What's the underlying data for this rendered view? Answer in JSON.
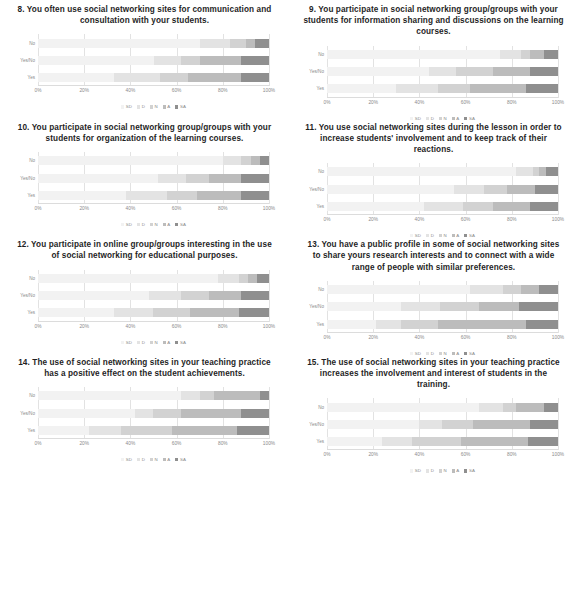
{
  "document": {
    "type": "survey-results-figure-page",
    "axis_ticks": [
      "0%",
      "20%",
      "40%",
      "60%",
      "80%",
      "100%"
    ],
    "category_labels": [
      "No",
      "Yes/No",
      "Yes"
    ],
    "legend": [
      {
        "label": "SD",
        "color": "#f2f2f2"
      },
      {
        "label": "D",
        "color": "#e3e3e3"
      },
      {
        "label": "N",
        "color": "#d2d2d2"
      },
      {
        "label": "A",
        "color": "#bcbcbc"
      },
      {
        "label": "SA",
        "color": "#8f8f8f"
      }
    ]
  },
  "chart_data": [
    {
      "type": "bar",
      "id": "q8",
      "title": "8. You often use social networking sites for communication and consultation with your students.",
      "orientation": "horizontal",
      "stacked": true,
      "normalized": true,
      "xlabel": "",
      "ylabel": "",
      "xlim": [
        0,
        100
      ],
      "grid": true,
      "legend_position": "bottom",
      "categories": [
        "No",
        "Yes/No",
        "Yes"
      ],
      "series": [
        {
          "name": "SD",
          "values": [
            70,
            50,
            33
          ]
        },
        {
          "name": "D",
          "values": [
            13,
            12,
            20
          ]
        },
        {
          "name": "N",
          "values": [
            7,
            8,
            12
          ]
        },
        {
          "name": "A",
          "values": [
            4,
            18,
            23
          ]
        },
        {
          "name": "SA",
          "values": [
            6,
            12,
            12
          ]
        }
      ]
    },
    {
      "type": "bar",
      "id": "q9",
      "title": "9. You participate in social networking group/groups with your students for information sharing and discussions on the learning courses.",
      "orientation": "horizontal",
      "stacked": true,
      "normalized": true,
      "xlabel": "",
      "ylabel": "",
      "xlim": [
        0,
        100
      ],
      "grid": true,
      "legend_position": "bottom",
      "categories": [
        "No",
        "Yes/No",
        "Yes"
      ],
      "series": [
        {
          "name": "SD",
          "values": [
            75,
            44,
            30
          ]
        },
        {
          "name": "D",
          "values": [
            9,
            12,
            18
          ]
        },
        {
          "name": "N",
          "values": [
            4,
            16,
            14
          ]
        },
        {
          "name": "A",
          "values": [
            6,
            16,
            24
          ]
        },
        {
          "name": "SA",
          "values": [
            6,
            12,
            14
          ]
        }
      ]
    },
    {
      "type": "bar",
      "id": "q10",
      "title": "10. You participate in social networking group/groups with your students for organization of the learning courses.",
      "orientation": "horizontal",
      "stacked": true,
      "normalized": true,
      "xlabel": "",
      "ylabel": "",
      "xlim": [
        0,
        100
      ],
      "grid": true,
      "legend_position": "bottom",
      "categories": [
        "No",
        "Yes/No",
        "Yes"
      ],
      "series": [
        {
          "name": "SD",
          "values": [
            80,
            52,
            38
          ]
        },
        {
          "name": "D",
          "values": [
            8,
            12,
            18
          ]
        },
        {
          "name": "N",
          "values": [
            4,
            10,
            13
          ]
        },
        {
          "name": "A",
          "values": [
            4,
            14,
            19
          ]
        },
        {
          "name": "SA",
          "values": [
            4,
            12,
            12
          ]
        }
      ]
    },
    {
      "type": "bar",
      "id": "q11",
      "title": "11. You use social networking sites during the lesson in order to increase students' involvement and to keep track of their reactions.",
      "orientation": "horizontal",
      "stacked": true,
      "normalized": true,
      "xlabel": "",
      "ylabel": "",
      "xlim": [
        0,
        100
      ],
      "grid": true,
      "legend_position": "bottom",
      "categories": [
        "No",
        "Yes/No",
        "Yes"
      ],
      "series": [
        {
          "name": "SD",
          "values": [
            82,
            55,
            42
          ]
        },
        {
          "name": "D",
          "values": [
            7,
            13,
            17
          ]
        },
        {
          "name": "N",
          "values": [
            3,
            10,
            13
          ]
        },
        {
          "name": "A",
          "values": [
            3,
            12,
            16
          ]
        },
        {
          "name": "SA",
          "values": [
            5,
            10,
            12
          ]
        }
      ]
    },
    {
      "type": "bar",
      "id": "q12",
      "title": "12. You participate in online group/groups interesting in the use of social networking for educational purposes.",
      "orientation": "horizontal",
      "stacked": true,
      "normalized": true,
      "xlabel": "",
      "ylabel": "",
      "xlim": [
        0,
        100
      ],
      "grid": true,
      "legend_position": "bottom",
      "categories": [
        "No",
        "Yes/No",
        "Yes"
      ],
      "series": [
        {
          "name": "SD",
          "values": [
            78,
            48,
            33
          ]
        },
        {
          "name": "D",
          "values": [
            9,
            14,
            17
          ]
        },
        {
          "name": "N",
          "values": [
            4,
            12,
            16
          ]
        },
        {
          "name": "A",
          "values": [
            4,
            14,
            21
          ]
        },
        {
          "name": "SA",
          "values": [
            5,
            12,
            13
          ]
        }
      ]
    },
    {
      "type": "bar",
      "id": "q13",
      "title": "13. You have a public profile in some of social networking sites to share yours research interests and to connect with a wide range of people with similar preferences.",
      "orientation": "horizontal",
      "stacked": true,
      "normalized": true,
      "xlabel": "",
      "ylabel": "",
      "xlim": [
        0,
        100
      ],
      "grid": true,
      "legend_position": "bottom",
      "categories": [
        "No",
        "Yes/No",
        "Yes"
      ],
      "series": [
        {
          "name": "SD",
          "values": [
            62,
            32,
            21
          ]
        },
        {
          "name": "D",
          "values": [
            14,
            17,
            11
          ]
        },
        {
          "name": "N",
          "values": [
            8,
            17,
            16
          ]
        },
        {
          "name": "A",
          "values": [
            8,
            17,
            38
          ]
        },
        {
          "name": "SA",
          "values": [
            8,
            17,
            14
          ]
        }
      ]
    },
    {
      "type": "bar",
      "id": "q14",
      "title": "14. The use of social networking sites in your teaching practice has a positive effect on the student achievements.",
      "orientation": "horizontal",
      "stacked": true,
      "normalized": true,
      "xlabel": "",
      "ylabel": "",
      "xlim": [
        0,
        100
      ],
      "grid": true,
      "legend_position": "bottom",
      "categories": [
        "No",
        "Yes/No",
        "Yes"
      ],
      "series": [
        {
          "name": "SD",
          "values": [
            62,
            42,
            22
          ]
        },
        {
          "name": "D",
          "values": [
            8,
            8,
            14
          ]
        },
        {
          "name": "N",
          "values": [
            6,
            12,
            22
          ]
        },
        {
          "name": "A",
          "values": [
            20,
            26,
            28
          ]
        },
        {
          "name": "SA",
          "values": [
            4,
            12,
            14
          ]
        }
      ]
    },
    {
      "type": "bar",
      "id": "q15",
      "title": "15. The use of social networking sites in your teaching practice increases the involvement and interest of students in the training.",
      "orientation": "horizontal",
      "stacked": true,
      "normalized": true,
      "xlabel": "",
      "ylabel": "",
      "xlim": [
        0,
        100
      ],
      "grid": true,
      "legend_position": "bottom",
      "categories": [
        "No",
        "Yes/No",
        "Yes"
      ],
      "series": [
        {
          "name": "SD",
          "values": [
            66,
            40,
            24
          ]
        },
        {
          "name": "D",
          "values": [
            10,
            10,
            13
          ]
        },
        {
          "name": "N",
          "values": [
            6,
            13,
            21
          ]
        },
        {
          "name": "A",
          "values": [
            12,
            25,
            29
          ]
        },
        {
          "name": "SA",
          "values": [
            6,
            12,
            13
          ]
        }
      ]
    }
  ]
}
